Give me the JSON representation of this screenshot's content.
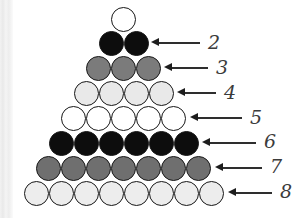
{
  "figure": {
    "title": "",
    "background_color": "#ffffff",
    "outline_color": "#171717",
    "label_color": "#3b3b3b",
    "arrow_color": "#2e2e2e",
    "geometry": {
      "ball_diameter": 25,
      "row_pitch_y": 25,
      "col_pitch_x": 25,
      "apex_center_x": 123,
      "apex_center_y": 19
    },
    "rows": [
      {
        "row_number": 1,
        "count": 1,
        "fill": "#ffffff",
        "fill_name": "white",
        "center_y": 19,
        "first_center_x": 123,
        "label": "",
        "has_arrow": false
      },
      {
        "row_number": 2,
        "count": 2,
        "fill": "#0d0d0d",
        "fill_name": "black",
        "center_y": 43,
        "first_center_x": 111,
        "label": "2",
        "has_arrow": true,
        "arrow_tip_x": 151,
        "arrow_tail_x": 200,
        "arrow_y": 43,
        "label_x": 208,
        "label_y": 33
      },
      {
        "row_number": 3,
        "count": 3,
        "fill": "#7b7b7b",
        "fill_name": "medium-gray",
        "center_y": 68,
        "first_center_x": 98,
        "label": "3",
        "has_arrow": true,
        "arrow_tip_x": 164,
        "arrow_tail_x": 208,
        "arrow_y": 68,
        "label_x": 216,
        "label_y": 58
      },
      {
        "row_number": 4,
        "count": 4,
        "fill": "#e9e9e9",
        "fill_name": "very-light-gray",
        "center_y": 93,
        "first_center_x": 86,
        "label": "4",
        "has_arrow": true,
        "arrow_tip_x": 177,
        "arrow_tail_x": 216,
        "arrow_y": 93,
        "label_x": 224,
        "label_y": 83
      },
      {
        "row_number": 5,
        "count": 5,
        "fill": "#ffffff",
        "fill_name": "white",
        "center_y": 118,
        "first_center_x": 73,
        "label": "5",
        "has_arrow": true,
        "arrow_tip_x": 190,
        "arrow_tail_x": 242,
        "arrow_y": 118,
        "label_x": 250,
        "label_y": 108
      },
      {
        "row_number": 6,
        "count": 6,
        "fill": "#0d0d0d",
        "fill_name": "black",
        "center_y": 143,
        "first_center_x": 61,
        "label": "6",
        "has_arrow": true,
        "arrow_tip_x": 202,
        "arrow_tail_x": 256,
        "arrow_y": 143,
        "label_x": 264,
        "label_y": 132
      },
      {
        "row_number": 7,
        "count": 7,
        "fill": "#6f6f6f",
        "fill_name": "medium-gray",
        "center_y": 168,
        "first_center_x": 48,
        "label": "7",
        "has_arrow": true,
        "arrow_tip_x": 215,
        "arrow_tail_x": 262,
        "arrow_y": 168,
        "label_x": 270,
        "label_y": 157
      },
      {
        "row_number": 8,
        "count": 8,
        "fill": "#ededed",
        "fill_name": "light-gray",
        "center_y": 193,
        "first_center_x": 36,
        "label": "8",
        "has_arrow": true,
        "arrow_tip_x": 228,
        "arrow_tail_x": 272,
        "arrow_y": 193,
        "label_x": 280,
        "label_y": 182
      }
    ]
  }
}
